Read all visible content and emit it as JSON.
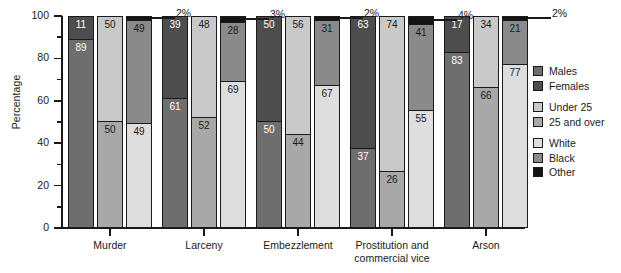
{
  "chart_data": {
    "type": "bar",
    "subtype": "grouped stacked bar (100% stacked)",
    "title": "",
    "xlabel": "",
    "ylabel": "Percentage",
    "ylim": [
      0,
      100
    ],
    "ytick_step": 20,
    "yminor_step": 10,
    "grid": false,
    "legend_position": "right",
    "ytick_labels": [
      "100",
      "80",
      "60",
      "40",
      "20",
      "0"
    ],
    "categories": [
      "Murder",
      "Larceny",
      "Embezzlement",
      "Prostitution and commercial vice",
      "Arson"
    ],
    "stacks": [
      {
        "name": "Sex",
        "series": [
          {
            "name": "Males",
            "color": "#6e6e6e",
            "values": [
              89,
              61,
              50,
              37,
              83
            ]
          },
          {
            "name": "Females",
            "color": "#4d4d4d",
            "values": [
              11,
              39,
              50,
              63,
              17
            ]
          }
        ]
      },
      {
        "name": "Age",
        "series": [
          {
            "name": "25 and over",
            "color": "#a8a8a8",
            "values": [
              50,
              52,
              44,
              26,
              66
            ]
          },
          {
            "name": "Under 25",
            "color": "#c9c9c9",
            "values": [
              50,
              48,
              56,
              74,
              34
            ]
          }
        ]
      },
      {
        "name": "Race",
        "series": [
          {
            "name": "White",
            "color": "#dedede",
            "values": [
              49,
              69,
              67,
              55,
              77
            ]
          },
          {
            "name": "Black",
            "color": "#8a8a8a",
            "values": [
              49,
              28,
              31,
              41,
              21
            ]
          },
          {
            "name": "Other",
            "color": "#141414",
            "values": [
              2,
              3,
              2,
              4,
              2
            ]
          }
        ]
      }
    ],
    "callouts": [
      {
        "category": "Murder",
        "series": "Other",
        "text": "2%"
      },
      {
        "category": "Larceny",
        "series": "Other",
        "text": "3%"
      },
      {
        "category": "Embezzlement",
        "series": "Other",
        "text": "2%"
      },
      {
        "category": "Prostitution and commercial vice",
        "series": "Other",
        "text": "4%"
      },
      {
        "category": "Arson",
        "series": "Other",
        "text": "2%"
      }
    ],
    "groups": [
      {
        "label_line1": "Murder",
        "label_line2": "",
        "bars": [
          {
            "stack": "Sex",
            "segments": [
              {
                "series": "Females",
                "value": 11
              },
              {
                "series": "Males",
                "value": 89
              }
            ]
          },
          {
            "stack": "Age",
            "segments": [
              {
                "series": "Under 25",
                "value": 50
              },
              {
                "series": "25 and over",
                "value": 50
              }
            ]
          },
          {
            "stack": "Race",
            "segments": [
              {
                "series": "Other",
                "value": 2
              },
              {
                "series": "Black",
                "value": 49
              },
              {
                "series": "White",
                "value": 49
              }
            ]
          }
        ],
        "callout": "2%"
      },
      {
        "label_line1": "Larceny",
        "label_line2": "",
        "bars": [
          {
            "stack": "Sex",
            "segments": [
              {
                "series": "Females",
                "value": 39
              },
              {
                "series": "Males",
                "value": 61
              }
            ]
          },
          {
            "stack": "Age",
            "segments": [
              {
                "series": "Under 25",
                "value": 48
              },
              {
                "series": "25 and over",
                "value": 52
              }
            ]
          },
          {
            "stack": "Race",
            "segments": [
              {
                "series": "Other",
                "value": 3
              },
              {
                "series": "Black",
                "value": 28
              },
              {
                "series": "White",
                "value": 69
              }
            ]
          }
        ],
        "callout": "3%"
      },
      {
        "label_line1": "Embezzlement",
        "label_line2": "",
        "bars": [
          {
            "stack": "Sex",
            "segments": [
              {
                "series": "Females",
                "value": 50
              },
              {
                "series": "Males",
                "value": 50
              }
            ]
          },
          {
            "stack": "Age",
            "segments": [
              {
                "series": "Under 25",
                "value": 56
              },
              {
                "series": "25 and over",
                "value": 44
              }
            ]
          },
          {
            "stack": "Race",
            "segments": [
              {
                "series": "Other",
                "value": 2
              },
              {
                "series": "Black",
                "value": 31
              },
              {
                "series": "White",
                "value": 67
              }
            ]
          }
        ],
        "callout": "2%"
      },
      {
        "label_line1": "Prostitution and",
        "label_line2": "commercial vice",
        "bars": [
          {
            "stack": "Sex",
            "segments": [
              {
                "series": "Females",
                "value": 63
              },
              {
                "series": "Males",
                "value": 37
              }
            ]
          },
          {
            "stack": "Age",
            "segments": [
              {
                "series": "Under 25",
                "value": 74
              },
              {
                "series": "25 and over",
                "value": 26
              }
            ]
          },
          {
            "stack": "Race",
            "segments": [
              {
                "series": "Other",
                "value": 4
              },
              {
                "series": "Black",
                "value": 41
              },
              {
                "series": "White",
                "value": 55
              }
            ]
          }
        ],
        "callout": "4%"
      },
      {
        "label_line1": "Arson",
        "label_line2": "",
        "bars": [
          {
            "stack": "Sex",
            "segments": [
              {
                "series": "Females",
                "value": 17
              },
              {
                "series": "Males",
                "value": 83
              }
            ]
          },
          {
            "stack": "Age",
            "segments": [
              {
                "series": "Under 25",
                "value": 34
              },
              {
                "series": "25 and over",
                "value": 66
              }
            ]
          },
          {
            "stack": "Race",
            "segments": [
              {
                "series": "Other",
                "value": 2
              },
              {
                "series": "Black",
                "value": 21
              },
              {
                "series": "White",
                "value": 77
              }
            ]
          }
        ],
        "callout": "2%"
      }
    ],
    "legend": [
      {
        "label": "Males",
        "color": "#6e6e6e"
      },
      {
        "label": "Females",
        "color": "#4d4d4d"
      },
      {
        "label": "Under 25",
        "color": "#c9c9c9"
      },
      {
        "label": "25 and over",
        "color": "#a8a8a8"
      },
      {
        "label": "White",
        "color": "#dedede"
      },
      {
        "label": "Black",
        "color": "#8a8a8a"
      },
      {
        "label": "Other",
        "color": "#141414"
      }
    ]
  }
}
